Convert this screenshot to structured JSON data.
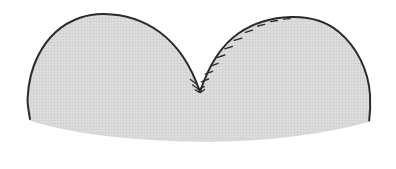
{
  "figure": {
    "title": "Bilobed heart-shaped outline with hatched margin",
    "type": "line-drawing",
    "canvas": {
      "width": 396,
      "height": 169,
      "background_color": "#ffffff"
    },
    "shape": {
      "name": "bilobed-closed-contour",
      "description": "Two rounded lobes meeting at a central downward notch, sitting on a wide shallow-curved base",
      "fill_color": "#dedede",
      "fill_texture": "fine-crosshatch-grid",
      "texture_line_color": "#c9c9c9",
      "texture_spacing_px": 3,
      "outline_color": "#2b2b2b",
      "outline_width_px": 2,
      "base_outline": "none",
      "base_edge_color": "#d8d8d8"
    },
    "geometry": {
      "left_lobe_apex": {
        "x": 104,
        "y": 14
      },
      "right_lobe_apex": {
        "x": 291,
        "y": 17
      },
      "central_notch": {
        "x": 200,
        "y": 92
      },
      "left_extreme": {
        "x": 27,
        "y": 101
      },
      "right_extreme": {
        "x": 370,
        "y": 96
      },
      "base_lowest_point": {
        "x": 205,
        "y": 141
      },
      "base_left_corner": {
        "x": 30,
        "y": 120
      },
      "base_right_corner": {
        "x": 369,
        "y": 121
      }
    },
    "hatch_marks": {
      "name": "suture-tick-marks",
      "count": 11,
      "color": "#2b2b2b",
      "length_px": 7,
      "orientation": "perpendicular-to-contour",
      "placed_along": "right lobe contour from central notch up and over to apex",
      "positions": [
        {
          "x": 201,
          "y": 88,
          "angle": 110
        },
        {
          "x": 205,
          "y": 80,
          "angle": 122
        },
        {
          "x": 209,
          "y": 72,
          "angle": 128
        },
        {
          "x": 215,
          "y": 64,
          "angle": 133
        },
        {
          "x": 222,
          "y": 55,
          "angle": 138
        },
        {
          "x": 230,
          "y": 46,
          "angle": 145
        },
        {
          "x": 240,
          "y": 37,
          "angle": 152
        },
        {
          "x": 251,
          "y": 29,
          "angle": 160
        },
        {
          "x": 263,
          "y": 23,
          "angle": 168
        },
        {
          "x": 275,
          "y": 19,
          "angle": 175
        },
        {
          "x": 287,
          "y": 17,
          "angle": 181
        }
      ],
      "notch_cluster": [
        {
          "x": 196,
          "y": 86,
          "angle": 60
        },
        {
          "x": 193,
          "y": 83,
          "angle": 55
        }
      ]
    },
    "labels": [],
    "annotations": []
  }
}
